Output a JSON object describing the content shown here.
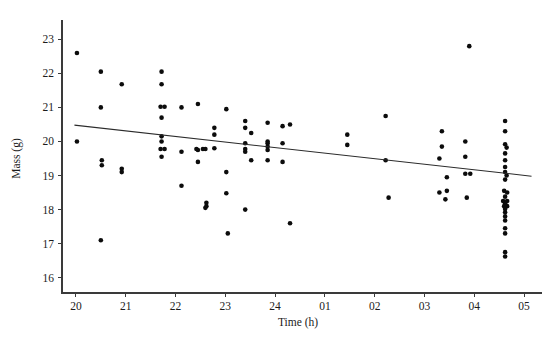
{
  "chart_data": {
    "type": "scatter",
    "title": "",
    "xlabel": "Time (h)",
    "ylabel": "Mass (g)",
    "xlim": [
      19.72,
      29.2
    ],
    "ylim": [
      15.55,
      23.45
    ],
    "grid": false,
    "legend": null,
    "x_tick_labels": [
      "20",
      "21",
      "22",
      "23",
      "24",
      "01",
      "02",
      "03",
      "04",
      "05"
    ],
    "x_tick_values": [
      20,
      21,
      22,
      23,
      24,
      25,
      26,
      27,
      28,
      29
    ],
    "y_tick_labels": [
      "16",
      "17",
      "18",
      "19",
      "20",
      "21",
      "22",
      "23"
    ],
    "y_tick_values": [
      16,
      17,
      18,
      19,
      20,
      21,
      22,
      23
    ],
    "marker": "circle",
    "marker_color": "#0c0c0c",
    "marker_radius": 2.3,
    "points": [
      [
        20.02,
        22.6
      ],
      [
        20.02,
        20.0
      ],
      [
        20.5,
        22.05
      ],
      [
        20.5,
        21.0
      ],
      [
        20.52,
        19.45
      ],
      [
        20.52,
        19.3
      ],
      [
        20.5,
        17.1
      ],
      [
        20.92,
        21.68
      ],
      [
        20.92,
        19.2
      ],
      [
        20.92,
        19.1
      ],
      [
        21.72,
        22.05
      ],
      [
        21.72,
        21.68
      ],
      [
        21.7,
        21.02
      ],
      [
        21.78,
        21.02
      ],
      [
        21.72,
        20.7
      ],
      [
        21.72,
        20.15
      ],
      [
        21.72,
        20.0
      ],
      [
        21.7,
        19.78
      ],
      [
        21.78,
        19.78
      ],
      [
        21.72,
        19.55
      ],
      [
        22.12,
        21.0
      ],
      [
        22.12,
        19.7
      ],
      [
        22.12,
        18.7
      ],
      [
        22.45,
        21.1
      ],
      [
        22.45,
        19.75
      ],
      [
        22.42,
        19.78
      ],
      [
        22.55,
        19.78
      ],
      [
        22.6,
        19.78
      ],
      [
        22.45,
        19.4
      ],
      [
        22.62,
        18.2
      ],
      [
        22.62,
        18.1
      ],
      [
        22.6,
        18.05
      ],
      [
        22.78,
        20.4
      ],
      [
        22.78,
        20.2
      ],
      [
        22.78,
        19.8
      ],
      [
        23.02,
        20.95
      ],
      [
        23.02,
        19.1
      ],
      [
        23.02,
        18.48
      ],
      [
        23.05,
        17.3
      ],
      [
        23.4,
        20.6
      ],
      [
        23.4,
        20.4
      ],
      [
        23.4,
        19.95
      ],
      [
        23.4,
        19.78
      ],
      [
        23.4,
        19.7
      ],
      [
        23.4,
        18.0
      ],
      [
        23.52,
        20.25
      ],
      [
        23.52,
        19.45
      ],
      [
        23.85,
        20.55
      ],
      [
        23.85,
        20.0
      ],
      [
        23.85,
        19.95
      ],
      [
        23.85,
        19.85
      ],
      [
        23.85,
        19.75
      ],
      [
        23.85,
        19.45
      ],
      [
        24.15,
        20.45
      ],
      [
        24.15,
        19.95
      ],
      [
        24.15,
        19.4
      ],
      [
        24.3,
        20.5
      ],
      [
        24.3,
        17.6
      ],
      [
        25.45,
        20.2
      ],
      [
        25.45,
        19.9
      ],
      [
        26.22,
        20.75
      ],
      [
        26.22,
        19.45
      ],
      [
        26.28,
        18.35
      ],
      [
        27.35,
        20.3
      ],
      [
        27.35,
        19.85
      ],
      [
        27.3,
        19.5
      ],
      [
        27.3,
        18.5
      ],
      [
        27.42,
        18.3
      ],
      [
        27.45,
        18.95
      ],
      [
        27.45,
        18.55
      ],
      [
        27.82,
        20.0
      ],
      [
        27.82,
        19.55
      ],
      [
        27.82,
        19.05
      ],
      [
        27.92,
        19.05
      ],
      [
        27.85,
        18.35
      ],
      [
        27.9,
        22.8
      ],
      [
        28.62,
        20.6
      ],
      [
        28.62,
        20.3
      ],
      [
        28.62,
        19.92
      ],
      [
        28.65,
        19.82
      ],
      [
        28.62,
        19.65
      ],
      [
        28.62,
        19.45
      ],
      [
        28.62,
        19.25
      ],
      [
        28.62,
        19.1
      ],
      [
        28.65,
        19.0
      ],
      [
        28.62,
        18.88
      ],
      [
        28.6,
        18.55
      ],
      [
        28.66,
        18.5
      ],
      [
        28.62,
        18.38
      ],
      [
        28.58,
        18.25
      ],
      [
        28.66,
        18.25
      ],
      [
        28.62,
        18.18
      ],
      [
        28.6,
        18.1
      ],
      [
        28.66,
        18.1
      ],
      [
        28.62,
        18.02
      ],
      [
        28.62,
        17.92
      ],
      [
        28.62,
        17.8
      ],
      [
        28.62,
        17.68
      ],
      [
        28.62,
        17.45
      ],
      [
        28.62,
        17.3
      ],
      [
        28.62,
        16.75
      ],
      [
        28.62,
        16.62
      ]
    ],
    "trend_line": {
      "x_start": 19.97,
      "y_start": 20.48,
      "x_end": 29.15,
      "y_end": 18.98,
      "color": "#2b2b2b"
    }
  }
}
